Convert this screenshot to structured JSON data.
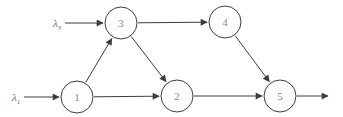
{
  "figure": {
    "type": "directed-graph",
    "background": "#ffffff",
    "stroke_color": "#3d3d3d",
    "node_fill": "#ffffff",
    "node_text_color": "#8a8a8a",
    "label_text_color": "#6f6f6f",
    "nodes": [
      {
        "id": "1",
        "label": "1",
        "x": 77,
        "y": 97,
        "r": 16
      },
      {
        "id": "2",
        "label": "2",
        "x": 177,
        "y": 96,
        "r": 16
      },
      {
        "id": "3",
        "label": "3",
        "x": 121,
        "y": 23,
        "r": 16
      },
      {
        "id": "4",
        "label": "4",
        "x": 225,
        "y": 22,
        "r": 16
      },
      {
        "id": "5",
        "label": "5",
        "x": 280,
        "y": 96,
        "r": 16
      }
    ],
    "edges": [
      {
        "from": "1",
        "to": "3"
      },
      {
        "from": "1",
        "to": "2"
      },
      {
        "from": "3",
        "to": "2"
      },
      {
        "from": "3",
        "to": "4"
      },
      {
        "from": "4",
        "to": "5"
      },
      {
        "from": "2",
        "to": "5"
      }
    ],
    "inputs": [
      {
        "name": "lambda3",
        "label": "λ",
        "sub": "3",
        "lx": 53,
        "ly": 26.5,
        "x1": 65,
        "y1": 23,
        "x2": 103,
        "y2": 23
      },
      {
        "name": "lambda1",
        "label": "λ",
        "sub": "1",
        "lx": 12,
        "ly": 100.5,
        "x1": 24,
        "y1": 97,
        "x2": 59,
        "y2": 97
      }
    ],
    "exit_arrow": {
      "x1": 297,
      "y1": 96,
      "x2": 328,
      "y2": 96
    }
  }
}
